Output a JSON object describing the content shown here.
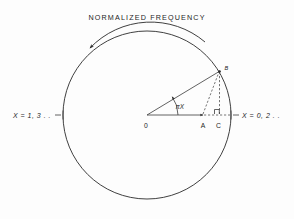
{
  "figure": {
    "title": "NORMALIZED  FREQUENCY",
    "rotation_direction": "counterclockwise",
    "background_color": "#fdfdfd",
    "ink_color": "#2a2a2a"
  },
  "labels": {
    "left_axis": "X = 1, 3 . .",
    "right_axis": "X = 0, 2 . .",
    "angle": "πX",
    "origin": "0",
    "point_a": "A",
    "point_b": "B",
    "point_c": "C"
  },
  "geometry": {
    "circle": {
      "cx": 147,
      "cy": 115,
      "r": 84,
      "units": "px"
    },
    "points": {
      "O": {
        "x": 147,
        "y": 115,
        "name": "origin"
      },
      "A": {
        "x": 203,
        "y": 115,
        "name": "point-on-radius-projection"
      },
      "B": {
        "x": 219,
        "y": 72,
        "name": "point-on-circle"
      },
      "C": {
        "x": 219,
        "y": 115,
        "name": "foot-of-perpendicular"
      }
    },
    "angle_degrees": 37.5,
    "right_angle_at": "C"
  },
  "elements": {
    "circle": "main-circle",
    "radius_line": "line-O-to-B",
    "horizontal_axis": "line-O-to-A-arrow",
    "dashed_chord": "dashed-line-A-to-B",
    "dashed_vertical": "dashed-line-B-to-C",
    "dashed_horizontal": "dashed-line-A-to-right-edge",
    "rotation_arc": "curved-arrow-arc",
    "right_angle_marker": "right-angle-square-at-C",
    "angle_arc": "angle-arc-at-origin",
    "tick_left": "tick-mark-left-edge",
    "tick_right": "tick-mark-right-edge"
  }
}
